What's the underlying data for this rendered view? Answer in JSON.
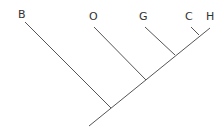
{
  "diagram": {
    "type": "cladogram",
    "taxa": [
      {
        "id": "B",
        "label": "B",
        "x": 19,
        "y": 9
      },
      {
        "id": "O",
        "label": "O",
        "x": 91,
        "y": 9
      },
      {
        "id": "G",
        "label": "G",
        "x": 140,
        "y": 9
      },
      {
        "id": "C",
        "label": "C",
        "x": 186,
        "y": 9
      },
      {
        "id": "H",
        "label": "H",
        "x": 206,
        "y": 9
      }
    ],
    "line_color": "#555555",
    "label_color": "#333333"
  }
}
